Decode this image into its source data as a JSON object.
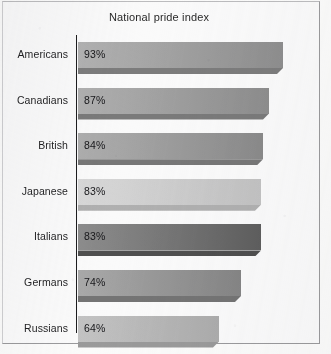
{
  "chart": {
    "title": "National pride index",
    "frame_border_color": "#9a9a9c",
    "axis_color": "#1d1d1f",
    "background": "#fafafa"
  },
  "chart_data": {
    "type": "bar",
    "orientation": "horizontal",
    "title": "National pride index",
    "xlabel": "",
    "ylabel": "",
    "xlim": [
      0,
      100
    ],
    "grid": false,
    "legend": null,
    "categories": [
      "Americans",
      "Canadians",
      "British",
      "Japanese",
      "Italians",
      "Germans",
      "Russians"
    ],
    "values": [
      93,
      87,
      84,
      83,
      83,
      74,
      64
    ],
    "value_labels": [
      "93%",
      "87%",
      "84%",
      "83%",
      "83%",
      "74%",
      "64%"
    ],
    "bars": [
      {
        "category": "Americans",
        "value": 93,
        "label": "93%",
        "fill_light": "#b2b2b2",
        "fill_dark": "#8e8e8e",
        "shadow": "#7c7c7c"
      },
      {
        "category": "Canadians",
        "value": 87,
        "label": "87%",
        "fill_light": "#b0b0b0",
        "fill_dark": "#8d8d8d",
        "shadow": "#7a7a7a"
      },
      {
        "category": "British",
        "value": 84,
        "label": "84%",
        "fill_light": "#aeaeae",
        "fill_dark": "#8a8a8a",
        "shadow": "#777777"
      },
      {
        "category": "Japanese",
        "value": 83,
        "label": "83%",
        "fill_light": "#d8d8d8",
        "fill_dark": "#c2c2c2",
        "shadow": "#b0b0b0"
      },
      {
        "category": "Italians",
        "value": 83,
        "label": "83%",
        "fill_light": "#8d8d8d",
        "fill_dark": "#5e5e5e",
        "shadow": "#4f4f4f"
      },
      {
        "category": "Germans",
        "value": 74,
        "label": "74%",
        "fill_light": "#a9a9a9",
        "fill_dark": "#858585",
        "shadow": "#747474"
      },
      {
        "category": "Russians",
        "value": 64,
        "label": "64%",
        "fill_light": "#c3c3c3",
        "fill_dark": "#acacac",
        "shadow": "#9a9a9a"
      }
    ]
  }
}
